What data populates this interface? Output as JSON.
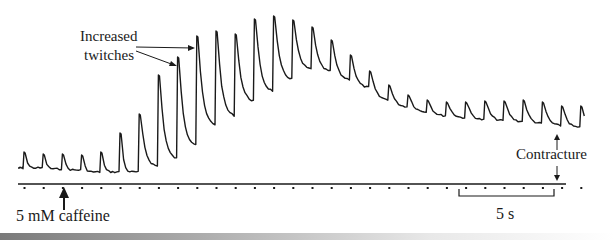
{
  "chart_data": {
    "type": "line",
    "title": "",
    "xlabel": "",
    "ylabel": "",
    "grid": false,
    "legend": null,
    "scale_bar": {
      "label": "5 s",
      "stimulus_intervals": 5
    },
    "stimulus_marks": {
      "count": 30,
      "spacing_px": 19.3
    },
    "annotations": [
      {
        "text": "Increased twitches",
        "lines": [
          "Increased",
          "twitches"
        ],
        "points_to": [
          "twitch 8",
          "twitch 9"
        ]
      },
      {
        "text": "5 mM caffeine",
        "marker": "up-arrow",
        "at_stimulus": 3
      },
      {
        "text": "Contracture",
        "marker": "double-arrow",
        "meaning": "elevated baseline tension vs. original baseline"
      }
    ],
    "series": [
      {
        "name": "twitch peaks (relative height above initial baseline, arbitrary units)",
        "x": [
          1,
          2,
          3,
          4,
          5,
          6,
          7,
          8,
          9,
          10,
          11,
          12,
          13,
          14,
          15,
          16,
          17,
          18,
          19,
          20,
          21,
          22,
          23,
          24,
          25,
          26,
          27,
          28,
          29,
          30
        ],
        "values": [
          16,
          14,
          14,
          13,
          16,
          35,
          54,
          93,
          111,
          132,
          137,
          134,
          149,
          152,
          148,
          141,
          128,
          113,
          97,
          83,
          73,
          68,
          66,
          66,
          67,
          67,
          68,
          66,
          62,
          62
        ]
      },
      {
        "name": "inter-twitch trough (relative baseline, arbitrary units)",
        "x": [
          1,
          2,
          3,
          4,
          5,
          6,
          7,
          8,
          9,
          10,
          11,
          12,
          13,
          14,
          15,
          16,
          17,
          18,
          19,
          20,
          21,
          22,
          23,
          24,
          25,
          26,
          27,
          28,
          29,
          30
        ],
        "values": [
          0,
          0,
          -1,
          -2,
          -4,
          -4,
          -4,
          1,
          8,
          22,
          42,
          51,
          66,
          76,
          88,
          98,
          96,
          88,
          80,
          68,
          61,
          56,
          52,
          50,
          48,
          47,
          46,
          44,
          42,
          40
        ]
      }
    ]
  },
  "labels": {
    "increased_line1": "Increased",
    "increased_line2": "twitches",
    "caffeine": "5 mM caffeine",
    "contracture": "Contracture",
    "scale": "5 s"
  },
  "colors": {
    "ink": "#1a1a1a",
    "background": "#ffffff"
  }
}
